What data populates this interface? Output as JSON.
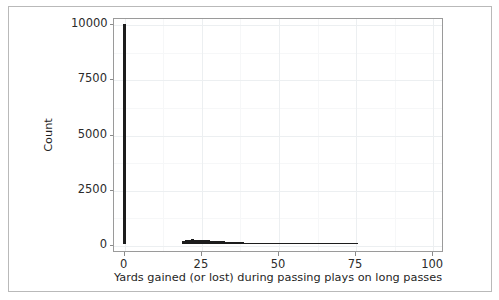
{
  "figure": {
    "background_color": "#ffffff",
    "frame_color": "#b9b9b9",
    "axes_spine_color": "#9a9a9a",
    "grid_color": "#eceff1",
    "bar_color": "#1c1c1c"
  },
  "chart_data": {
    "type": "bar",
    "chart_subtype": "histogram",
    "title": "",
    "xlabel": "Yards gained (or lost) during passing plays on long passes",
    "ylabel": "Count",
    "xlim": [
      -3.5,
      103.5
    ],
    "ylim": [
      -320,
      10280
    ],
    "xticks": [
      0,
      25,
      50,
      75,
      100
    ],
    "xtick_labels": [
      "0",
      "25",
      "50",
      "75",
      "100"
    ],
    "yticks": [
      0,
      2500,
      5000,
      7500,
      10000
    ],
    "ytick_labels": [
      "0",
      "2500",
      "5000",
      "7500",
      "10000"
    ],
    "grid": true,
    "legend": false,
    "bin_width": 1,
    "x": [
      0,
      1,
      2,
      3,
      4,
      5,
      6,
      7,
      8,
      9,
      10,
      11,
      12,
      13,
      14,
      15,
      16,
      17,
      18,
      19,
      20,
      21,
      22,
      23,
      24,
      25,
      26,
      27,
      28,
      29,
      30,
      31,
      32,
      33,
      34,
      35,
      36,
      37,
      38,
      39,
      40,
      41,
      42,
      43,
      44,
      45,
      46,
      47,
      48,
      49,
      50,
      51,
      52,
      53,
      54,
      55,
      56,
      57,
      58,
      59,
      60,
      61,
      62,
      63,
      64,
      65,
      66,
      67,
      68,
      69,
      70,
      71,
      72,
      73,
      74,
      75,
      76,
      77,
      78,
      79,
      80,
      81,
      82,
      83,
      84,
      85,
      86,
      87,
      88,
      89,
      90,
      91,
      92,
      93,
      94,
      95,
      96,
      97,
      98,
      99,
      100
    ],
    "values": [
      9950,
      0,
      0,
      0,
      0,
      0,
      0,
      0,
      0,
      0,
      0,
      0,
      0,
      0,
      0,
      0,
      0,
      0,
      0,
      130,
      175,
      190,
      205,
      200,
      195,
      185,
      170,
      160,
      150,
      140,
      130,
      120,
      112,
      104,
      96,
      88,
      80,
      74,
      68,
      62,
      56,
      50,
      45,
      41,
      37,
      33,
      29,
      26,
      23,
      20,
      18,
      16,
      14,
      12,
      10,
      9,
      8,
      7,
      6,
      5,
      5,
      4,
      4,
      3,
      3,
      3,
      2,
      2,
      2,
      2,
      1,
      1,
      1,
      1,
      1,
      12,
      0,
      0,
      0,
      0,
      0,
      0,
      0,
      0,
      0,
      0,
      0,
      0,
      0,
      0,
      0,
      0,
      0,
      0,
      0,
      0,
      0,
      0,
      0,
      0,
      0
    ]
  }
}
